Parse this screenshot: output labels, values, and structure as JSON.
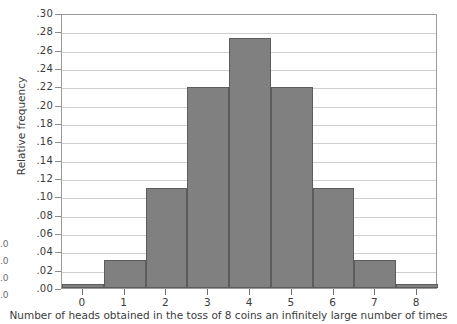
{
  "chart_data": {
    "type": "bar",
    "title": "",
    "subtitle": "",
    "xlabel": "Number of heads obtained in the toss of 8 coins an infinitely large number of times",
    "ylabel": "Relative frequency",
    "categories": [
      "0",
      "1",
      "2",
      "3",
      "4",
      "5",
      "6",
      "7",
      "8"
    ],
    "values": [
      0.004,
      0.031,
      0.109,
      0.219,
      0.273,
      0.219,
      0.109,
      0.031,
      0.004
    ],
    "xlim": [
      -0.5,
      8.5
    ],
    "ylim": [
      0.0,
      0.3
    ],
    "ytick_labels": [
      ".30",
      ".28",
      ".26",
      ".24",
      ".22",
      ".20",
      ".18",
      ".16",
      ".14",
      ".12",
      ".10",
      ".08",
      ".06",
      ".04",
      ".02",
      ".00"
    ],
    "ytick_values": [
      0.3,
      0.28,
      0.26,
      0.24,
      0.22,
      0.2,
      0.18,
      0.16,
      0.14,
      0.12,
      0.1,
      0.08,
      0.06,
      0.04,
      0.02,
      0.0
    ],
    "xtick_labels": [
      "0",
      "1",
      "2",
      "3",
      "4",
      "5",
      "6",
      "7",
      "8"
    ],
    "xtick_values": [
      0,
      1,
      2,
      3,
      4,
      5,
      6,
      7,
      8
    ],
    "grid": "horizontal",
    "legend": "none",
    "bar_color": "#808080",
    "bar_edge_color": "#5c5c5c",
    "grid_color": "#cfcfcf",
    "frame_color": "#9a9a9a",
    "background_color": "#ffffff"
  },
  "edge_remnant": {
    "lines": [
      ".0",
      ".0",
      ".0",
      ".0"
    ]
  }
}
